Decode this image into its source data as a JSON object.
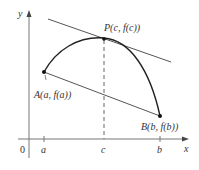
{
  "figure": {
    "axes": {
      "x_label": "x",
      "y_label": "y",
      "origin_label": "0",
      "x_ticks": [
        "a",
        "c",
        "b"
      ]
    },
    "points": {
      "A": {
        "label": "A(a, f(a))"
      },
      "B": {
        "label": "B(b, f(b))"
      },
      "P": {
        "label": "P(c, f(c))"
      }
    },
    "colors": {
      "curve": "#222222",
      "lines": "#555555",
      "axes": "#666666",
      "text": "#333333"
    }
  }
}
